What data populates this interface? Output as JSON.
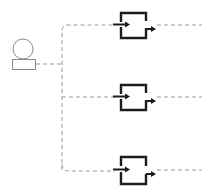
{
  "diagram": {
    "type": "fan-out flow",
    "colors": {
      "connector": "#9a9a9a",
      "actor": "#8a8a8a",
      "process": "#1c1c1c",
      "background": "#ffffff"
    },
    "source": {
      "icon": "user-icon",
      "label": ""
    },
    "branches": [
      {
        "icon": "process-box-icon",
        "y": 25
      },
      {
        "icon": "process-box-icon",
        "y": 97
      },
      {
        "icon": "process-box-icon",
        "y": 170
      }
    ]
  }
}
